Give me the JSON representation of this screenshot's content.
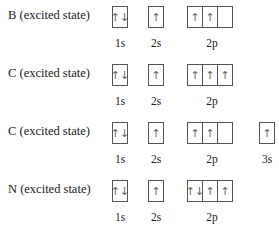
{
  "rows": [
    {
      "label": "B (excited state)",
      "orbitals": [
        {
          "name": "1s",
          "boxes": [
            "↑↓"
          ]
        },
        {
          "name": "2s",
          "boxes": [
            "↑"
          ]
        },
        {
          "name": "2p",
          "boxes": [
            "↑",
            "↑",
            ""
          ]
        }
      ]
    },
    {
      "label": "C (excited state)",
      "orbitals": [
        {
          "name": "1s",
          "boxes": [
            "↑↓"
          ]
        },
        {
          "name": "2s",
          "boxes": [
            "↑"
          ]
        },
        {
          "name": "2p",
          "boxes": [
            "↑",
            "↑",
            "↑"
          ]
        }
      ]
    },
    {
      "label": "C (excited state)",
      "orbitals": [
        {
          "name": "1s",
          "boxes": [
            "↑↓"
          ]
        },
        {
          "name": "2s",
          "boxes": [
            "↑"
          ]
        },
        {
          "name": "2p",
          "boxes": [
            "↑",
            "↑",
            ""
          ]
        },
        {
          "name": "3s",
          "boxes": [
            "↑"
          ]
        }
      ]
    },
    {
      "label": "N (excited state)",
      "orbitals": [
        {
          "name": "1s",
          "boxes": [
            "↑↓"
          ]
        },
        {
          "name": "2s",
          "boxes": [
            "↑"
          ]
        },
        {
          "name": "2p",
          "boxes": [
            "↑↓",
            "↑",
            "↑"
          ]
        }
      ]
    }
  ]
}
